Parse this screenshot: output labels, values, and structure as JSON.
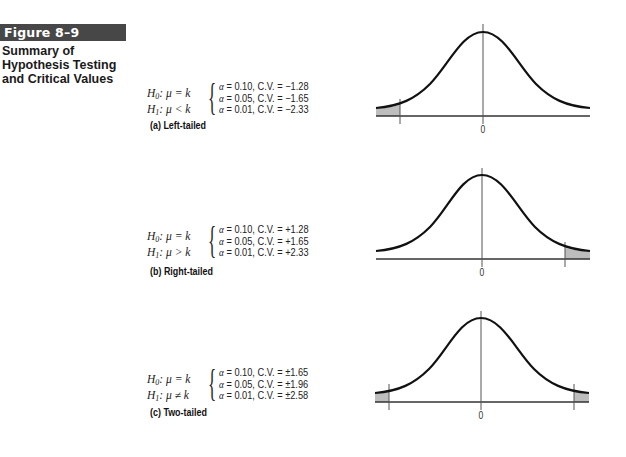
{
  "figure": {
    "label": "Figure 8–9",
    "caption_lines": [
      "Summary of",
      "Hypothesis Testing",
      "and Critical Values"
    ],
    "header_color": "#474747"
  },
  "panels": [
    {
      "id": "a",
      "label": "(a) Left-tailed",
      "h0": {
        "prefix": "H",
        "sub": "0",
        "text": ": μ  =  k"
      },
      "h1": {
        "prefix": "H",
        "sub": "1",
        "text": ": μ  <  k"
      },
      "alphas": [
        {
          "alpha": "α",
          "text": " = 0.10, C.V. = −1.28"
        },
        {
          "alpha": "α",
          "text": " = 0.05, C.V. = −1.65"
        },
        {
          "alpha": "α",
          "text": " = 0.01, C.V. = −2.33"
        }
      ],
      "axis_label": "0"
    },
    {
      "id": "b",
      "label": "(b) Right-tailed",
      "h0": {
        "prefix": "H",
        "sub": "0",
        "text": ": μ  =  k"
      },
      "h1": {
        "prefix": "H",
        "sub": "1",
        "text": ": μ  >  k"
      },
      "alphas": [
        {
          "alpha": "α",
          "text": " = 0.10, C.V. = +1.28"
        },
        {
          "alpha": "α",
          "text": " = 0.05, C.V. = +1.65"
        },
        {
          "alpha": "α",
          "text": " = 0.01, C.V. = +2.33"
        }
      ],
      "axis_label": "0"
    },
    {
      "id": "c",
      "label": "(c) Two-tailed",
      "h0": {
        "prefix": "H",
        "sub": "0",
        "text": ": μ  =  k"
      },
      "h1": {
        "prefix": "H",
        "sub": "1",
        "text": ": μ  ≠  k"
      },
      "alphas": [
        {
          "alpha": "α",
          "text": " = 0.10, C.V. = ±1.65"
        },
        {
          "alpha": "α",
          "text": " = 0.05, C.V. = ±1.96"
        },
        {
          "alpha": "α",
          "text": " = 0.01, C.V. = ±2.58"
        }
      ],
      "axis_label": "0"
    }
  ],
  "colors": {
    "curve": "#111111",
    "shade": "#bdbdbd",
    "axis": "#333333"
  }
}
